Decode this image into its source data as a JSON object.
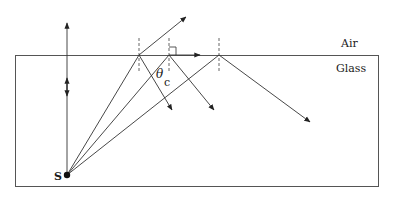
{
  "diagram": {
    "labels": {
      "air": "Air",
      "glass": "Glass",
      "source": "S",
      "theta": "θ",
      "theta_sub": "c"
    },
    "colors": {
      "line": "#333333",
      "background": "#ffffff"
    }
  }
}
